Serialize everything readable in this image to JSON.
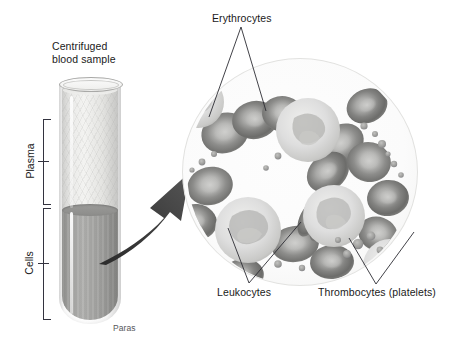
{
  "figure": {
    "title": "Centrifuged\nblood sample",
    "credit": "Paras"
  },
  "tube": {
    "layers": [
      {
        "name": "plasma",
        "label": "Plasma"
      },
      {
        "name": "cells",
        "label": "Cells"
      }
    ]
  },
  "magnified_view": {
    "labels": [
      {
        "key": "erythrocytes",
        "text": "Erythrocytes"
      },
      {
        "key": "leukocytes",
        "text": "Leukocytes"
      },
      {
        "key": "thrombocytes",
        "text": "Thrombocytes (platelets)"
      }
    ]
  },
  "colors": {
    "background": "#ffffff",
    "text": "#1a1a1a",
    "leader_line": "#2c2c33",
    "arrow": "#3a3a3a",
    "plasma_fill": "#e8e8e6",
    "cells_fill": "#9d9d9b",
    "erythrocyte": "#8f8f8d",
    "leukocyte": "#cfcfcd",
    "thrombocyte": "#a8a8a6"
  }
}
